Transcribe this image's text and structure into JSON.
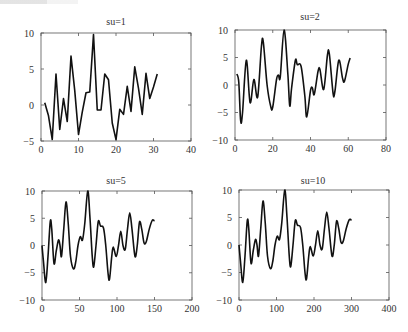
{
  "chart_data": [
    {
      "type": "line",
      "title": "su=1",
      "xlabel": "",
      "ylabel": "",
      "xlim": [
        0,
        40
      ],
      "ylim": [
        -5,
        10
      ],
      "xticks": [
        0,
        10,
        20,
        30,
        40
      ],
      "yticks": [
        -5,
        0,
        5,
        10
      ],
      "ytick_labels": [
        "−5",
        "0",
        "5",
        "10"
      ],
      "grid": false,
      "box": {
        "left": 41,
        "top": 33,
        "right": 191,
        "bottom": 141
      },
      "title_pos": {
        "x": 116,
        "y": 25
      },
      "series": [
        {
          "name": "su=1",
          "x": [
            1,
            2,
            3,
            4,
            5,
            6,
            7,
            8,
            9,
            10,
            11,
            12,
            13,
            14,
            15,
            16,
            17,
            18,
            19,
            20,
            21,
            22,
            23,
            24,
            25,
            26,
            27,
            28,
            29,
            30,
            31
          ],
          "y": [
            0.3,
            -1.5,
            -4.8,
            4.3,
            -3.4,
            0.9,
            -2.3,
            6.8,
            2.0,
            -4.1,
            -1.0,
            1.7,
            1.8,
            9.8,
            -0.7,
            -0.7,
            4.3,
            3.5,
            -2.5,
            -4.8,
            -0.6,
            -1.3,
            2.6,
            -0.9,
            5.3,
            2.3,
            -1.3,
            4.4,
            0.9,
            2.5,
            4.3
          ]
        }
      ]
    },
    {
      "type": "line",
      "title": "su=2",
      "xlabel": "",
      "ylabel": "",
      "xlim": [
        0,
        80
      ],
      "ylim": [
        -10,
        10
      ],
      "xticks": [
        0,
        20,
        40,
        60,
        80
      ],
      "yticks": [
        -10,
        -5,
        0,
        5,
        10
      ],
      "ytick_labels": [
        "−10",
        "−5",
        "0",
        "5",
        "10"
      ],
      "grid": false,
      "box": {
        "left": 235,
        "top": 30,
        "right": 386,
        "bottom": 140
      },
      "title_pos": {
        "x": 310,
        "y": 20
      },
      "series": [
        {
          "name": "su=2",
          "x": [
            1,
            2,
            3,
            4,
            6,
            8,
            10,
            12,
            14,
            15,
            17,
            19,
            20,
            22,
            23,
            24,
            26,
            28,
            29,
            30,
            32,
            33,
            35,
            37,
            38,
            40,
            41,
            42,
            44,
            45,
            47,
            49,
            50,
            52,
            53,
            55,
            57,
            58,
            60,
            61
          ],
          "y": [
            2,
            0.5,
            -6.5,
            -5,
            4.5,
            -3.2,
            1,
            -2.2,
            7,
            7.8,
            0,
            -4,
            -4,
            1,
            1.8,
            1.5,
            10,
            2,
            -3.8,
            -0.5,
            4.5,
            3.7,
            3.4,
            -2,
            -5.8,
            -1,
            -0.5,
            -1.7,
            2.5,
            2.8,
            -0.8,
            5.5,
            5.6,
            -1.6,
            -1,
            4.5,
            1.2,
            0.7,
            3.8,
            4.9
          ]
        }
      ]
    },
    {
      "type": "line",
      "title": "su=5",
      "xlabel": "",
      "ylabel": "",
      "xlim": [
        0,
        200
      ],
      "ylim": [
        -10,
        10
      ],
      "xticks": [
        0,
        50,
        100,
        150,
        200
      ],
      "yticks": [
        -10,
        -5,
        0,
        5,
        10
      ],
      "ytick_labels": [
        "−10",
        "−5",
        "0",
        "5",
        "10"
      ],
      "grid": false,
      "box": {
        "left": 42,
        "top": 191,
        "right": 192,
        "bottom": 300
      },
      "title_pos": {
        "x": 116,
        "y": 184
      },
      "series": [
        {
          "name": "su=5",
          "x": [
            0,
            2,
            5,
            8,
            11,
            13,
            16,
            19,
            22,
            24,
            26,
            29,
            32,
            35,
            38,
            42,
            45,
            48,
            51,
            54,
            57,
            61,
            64,
            67,
            69,
            72,
            75,
            78,
            82,
            85,
            88,
            90,
            93,
            95,
            99,
            102,
            105,
            108,
            111,
            114,
            117,
            120,
            124,
            127,
            130,
            133,
            136,
            139,
            143,
            147,
            150
          ],
          "y": [
            0,
            -3,
            -6.8,
            -2,
            4.4,
            3,
            -3.3,
            -1,
            1,
            0,
            -2,
            3,
            8,
            4,
            -2,
            -4.3,
            -3,
            0,
            1.6,
            1,
            4,
            10,
            5,
            -2,
            -3.9,
            0,
            4.4,
            3.6,
            3.2,
            0,
            -5,
            -6.2,
            -2,
            -0.3,
            -2,
            0,
            2.6,
            0,
            -0.7,
            3,
            6,
            3,
            -2,
            0,
            4.3,
            3,
            0.5,
            0.7,
            3,
            4.6,
            4.5
          ]
        }
      ]
    },
    {
      "type": "line",
      "title": "su=10",
      "xlabel": "",
      "ylabel": "",
      "xlim": [
        0,
        400
      ],
      "ylim": [
        -10,
        10
      ],
      "xticks": [
        0,
        100,
        200,
        300,
        400
      ],
      "yticks": [
        -10,
        -5,
        0,
        5,
        10
      ],
      "ytick_labels": [
        "−10",
        "−5",
        "0",
        "5",
        "10"
      ],
      "grid": false,
      "box": {
        "left": 239,
        "top": 190,
        "right": 389,
        "bottom": 300
      },
      "title_pos": {
        "x": 313,
        "y": 184
      },
      "series": [
        {
          "name": "su=10",
          "x": [
            0,
            4,
            10,
            16,
            22,
            26,
            32,
            38,
            44,
            48,
            52,
            58,
            64,
            70,
            76,
            84,
            90,
            96,
            102,
            108,
            114,
            122,
            128,
            134,
            138,
            144,
            150,
            156,
            164,
            170,
            176,
            180,
            186,
            190,
            198,
            204,
            210,
            216,
            222,
            228,
            234,
            240,
            248,
            254,
            260,
            266,
            272,
            278,
            286,
            294,
            300
          ],
          "y": [
            0,
            -3,
            -6.8,
            -2,
            4.4,
            3,
            -3.3,
            -1,
            1,
            0,
            -2,
            3,
            8,
            4,
            -2,
            -4.3,
            -3,
            0,
            1.6,
            1,
            4,
            10,
            5,
            -2,
            -3.9,
            0,
            4.4,
            3.6,
            3.2,
            0,
            -5,
            -6.2,
            -2,
            -0.3,
            -2,
            0,
            2.6,
            0,
            -0.7,
            3,
            6,
            3,
            -2,
            0,
            4.3,
            3,
            0.5,
            0.7,
            3,
            4.6,
            4.5
          ]
        }
      ]
    }
  ]
}
